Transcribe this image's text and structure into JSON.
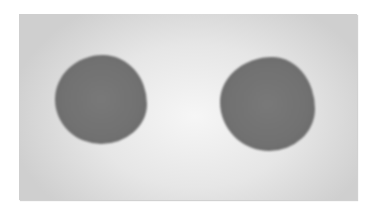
{
  "image": {
    "description": "Grayscale photo of two dark gray roughly circular spots on a light gray card",
    "spots": [
      {
        "position": "left",
        "color": "#707070"
      },
      {
        "position": "right",
        "color": "#707070"
      }
    ],
    "card_color": "#e6e6e6",
    "background_color": "#ffffff"
  }
}
